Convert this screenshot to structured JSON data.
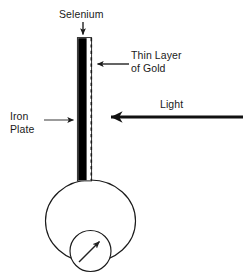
{
  "diagram": {
    "type": "physics-schematic",
    "canvas": {
      "width": 243,
      "height": 274
    },
    "colors": {
      "background": "#ffffff",
      "stroke": "#1a1a1a",
      "selenium_fill": "#000000",
      "gold_layer_stroke": "#1a1a1a",
      "text": "#1a1a1a"
    },
    "labels": {
      "selenium": "Selenium",
      "thin_layer_of_gold": "Thin Layer\nof Gold",
      "iron_plate": "Iron\nPlate",
      "light": "Light"
    },
    "parts": [
      {
        "name": "selenium-bar",
        "description": "vertical black filled bar",
        "x": 78,
        "y": 38,
        "width": 9,
        "height": 142,
        "fill": "#000000"
      },
      {
        "name": "gold-layer-line",
        "description": "dashed vertical line to the right of the bar",
        "x": 91,
        "y": 38,
        "height": 142,
        "style": "dashed"
      },
      {
        "name": "circuit-loop",
        "description": "large circle forming the circuit",
        "cx": 90,
        "cy": 221,
        "rx": 45,
        "ry": 41
      },
      {
        "name": "meter",
        "description": "small circular meter with needle",
        "cx": 90,
        "cy": 251,
        "r": 20,
        "needle_angle_deg": 45
      }
    ],
    "arrows": [
      {
        "name": "selenium-pointer",
        "direction": "down",
        "from": [
          83,
          23
        ],
        "to": [
          83,
          37
        ],
        "weight": "thin"
      },
      {
        "name": "gold-pointer",
        "direction": "left",
        "from": [
          128,
          64
        ],
        "to": [
          95,
          64
        ],
        "weight": "thin"
      },
      {
        "name": "iron-plate-pointer",
        "direction": "right",
        "from": [
          45,
          120
        ],
        "to": [
          76,
          120
        ],
        "weight": "thin"
      },
      {
        "name": "light-ray",
        "direction": "left",
        "from": [
          242,
          117
        ],
        "to": [
          102,
          117
        ],
        "weight": "thick"
      },
      {
        "name": "meter-needle",
        "direction": "up-right",
        "from": [
          80,
          261
        ],
        "to": [
          100,
          241
        ],
        "weight": "thin"
      }
    ]
  }
}
